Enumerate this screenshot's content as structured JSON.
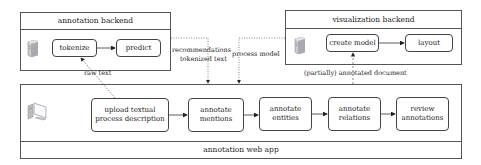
{
  "annotation_backend": {
    "title": "annotation backend",
    "nodes": [
      {
        "label": "tokenize"
      },
      {
        "label": "predict"
      }
    ]
  },
  "visualization_backend": {
    "title": "visualization backend",
    "nodes": [
      {
        "label": "create model"
      },
      {
        "label": "layout"
      }
    ]
  },
  "web_app": {
    "title": "annotation web app",
    "steps": [
      {
        "line1": "upload textual",
        "line2": "process description"
      },
      {
        "line1": "annotate",
        "line2": "mentions"
      },
      {
        "line1": "annotate",
        "line2": "entities"
      },
      {
        "line1": "annotate",
        "line2": "relations"
      },
      {
        "line1": "review",
        "line2": "annotations"
      }
    ]
  },
  "edges": {
    "raw_text": "raw text",
    "recommendations_line1": "recommendations",
    "recommendations_line2": "tokenized text",
    "process_model": "process model",
    "annotated_document": "(partially) annotated document"
  },
  "icons": {
    "server": "server-icon",
    "computer": "computer-icon"
  },
  "colors": {
    "border": "#555555",
    "text": "#222222",
    "background": "#ffffff"
  }
}
